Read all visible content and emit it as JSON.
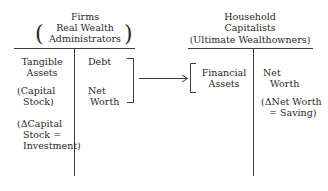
{
  "firms": {
    "title": "Firms",
    "subtitle_line1": "Real Wealth",
    "subtitle_line2": "Administrators",
    "left_paren": "(",
    "right_paren": ")",
    "assets": {
      "line1": "Tangible",
      "line2": "Assets",
      "note1_line1": "(Capital",
      "note1_line2": "Stock)",
      "note2_line1": "(ΔCapital",
      "note2_line2": "Stock =",
      "note2_line3": "Investment)"
    },
    "liabilities": {
      "debt": "Debt",
      "net_line1": "Net",
      "net_line2": "Worth"
    }
  },
  "households": {
    "title_line1": "Household",
    "title_line2": "Capitalists",
    "title_line3": "(Ultimate Wealthowners)",
    "assets": {
      "line1": "Financial",
      "line2": "Assets"
    },
    "liabilities": {
      "net_line1": "Net",
      "net_line2": "Worth",
      "note_line1": "(ΔNet Worth",
      "note_line2": "= Saving)"
    }
  },
  "colors": {
    "ink": "#2a2a2a",
    "background": "#ffffff"
  }
}
